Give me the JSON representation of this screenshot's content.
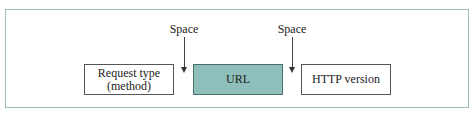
{
  "diagram": {
    "caption_fragment": "g...  ...p...",
    "fields": [
      {
        "id": "method",
        "line1": "Request type",
        "line2": "(method)",
        "fill": "#ffffff"
      },
      {
        "id": "url",
        "line1": "URL",
        "fill": "#8fbfbb"
      },
      {
        "id": "version",
        "line1": "HTTP version",
        "fill": "#ffffff"
      }
    ],
    "separators": [
      {
        "label": "Space",
        "between": [
          "method",
          "url"
        ]
      },
      {
        "label": "Space",
        "between": [
          "url",
          "version"
        ]
      }
    ],
    "colors": {
      "frame_border": "#9dbdb7",
      "highlight_fill": "#8fbfbb"
    }
  }
}
